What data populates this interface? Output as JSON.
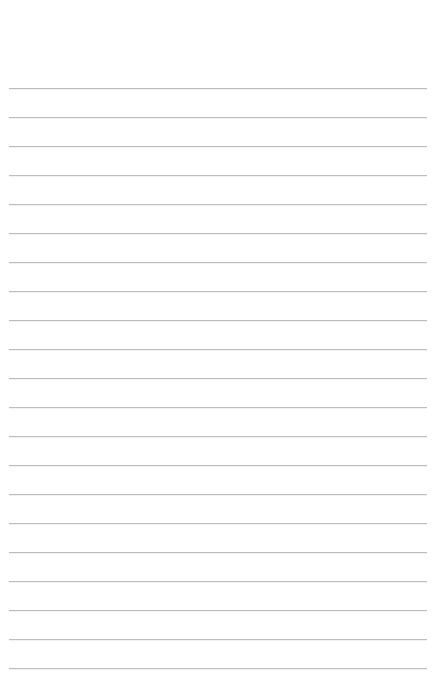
{
  "page": {
    "type": "lined-paper",
    "background_color": "#ffffff",
    "rule_color": "#bdbdbd",
    "rule_count": 21,
    "first_rule_y": 88,
    "rule_spacing": 29,
    "rule_left": 9,
    "rule_width": 418,
    "text_lines": []
  }
}
